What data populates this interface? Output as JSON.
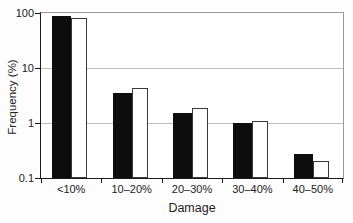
{
  "figure": {
    "xlabel": "Damage",
    "ylabel": "Frequency (%)"
  },
  "chart_data": {
    "type": "bar",
    "y_scale": "log",
    "title": "",
    "xlabel": "Damage",
    "ylabel": "Frequency (%)",
    "categories": [
      "<10%",
      "10–20%",
      "20–30%",
      "30–40%",
      "40–50%"
    ],
    "series": [
      {
        "name": "filled-black-bars",
        "fill": "#0d0d0d",
        "values": [
          90,
          3.5,
          1.5,
          1.0,
          0.27
        ]
      },
      {
        "name": "open-white-bars",
        "fill": "#ffffff",
        "stroke": "#3a3a3a",
        "values": [
          80,
          4.4,
          1.9,
          1.1,
          0.2
        ]
      }
    ],
    "ylim": [
      0.1,
      100
    ],
    "yticks": [
      100,
      10,
      1,
      0.1
    ],
    "ytick_labels": [
      "100",
      "10",
      "1",
      "0.1"
    ],
    "grid": "horizontal lines at powers of 10",
    "legend": "none"
  },
  "colors": {
    "bar_fill": "#0d0d0d",
    "open_bar_stroke": "#3a3a3a",
    "grid": "#bcbcbc",
    "axis_dark": "#1a1a1a",
    "frame_light": "#9a9a9a",
    "text": "#222222",
    "background": "#fdfdfd"
  }
}
